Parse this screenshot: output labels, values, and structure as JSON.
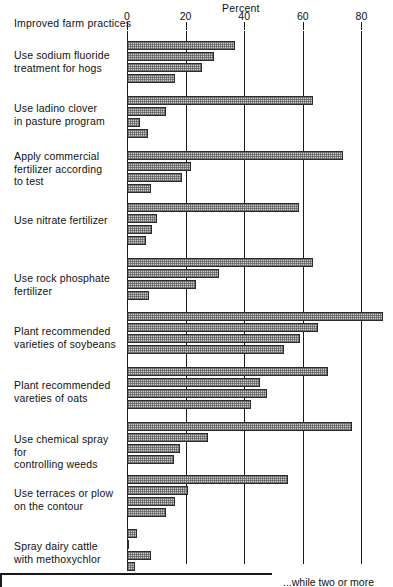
{
  "header": {
    "percent_title": "Percent",
    "category_axis_title": "Improved farm practices"
  },
  "axis": {
    "ticks": [
      "0",
      "20",
      "40",
      "60",
      "80"
    ],
    "tick_values": [
      0,
      20,
      40,
      60,
      80
    ]
  },
  "caption": {
    "fragment": "...while two or more"
  },
  "chart_data": {
    "type": "bar",
    "orientation": "horizontal",
    "title": "Percent",
    "xlabel": "Percent",
    "ylabel": "Improved farm practices",
    "xlim": [
      0,
      90
    ],
    "grid": true,
    "legend_position": "bottom-cropped",
    "categories": [
      "Use sodium fluoride treatment for hogs",
      "Use ladino clover in pasture program",
      "Apply commercial fertilizer according to test",
      "Use nitrate fertilizer",
      "Use rock phosphate fertilizer",
      "Plant recommended varieties of soybeans",
      "Plant recommended vareties of oats",
      "Use chemical spray for controlling weeds",
      "Use terraces or plow on the contour",
      "Spray dairy cattle with methoxychlor"
    ],
    "series": [
      {
        "name": "series-1",
        "values": [
          36.9,
          63.5,
          73.7,
          58.7,
          63.5,
          87.4,
          68.6,
          76.8,
          55.0,
          3.4
        ]
      },
      {
        "name": "series-2",
        "values": [
          29.7,
          13.3,
          21.8,
          10.2,
          31.4,
          65.2,
          45.4,
          27.6,
          20.8,
          0.8
        ]
      },
      {
        "name": "series-3",
        "values": [
          25.6,
          4.4,
          18.8,
          8.5,
          23.5,
          59.0,
          47.8,
          18.1,
          16.4,
          8.2
        ]
      },
      {
        "name": "series-4",
        "values": [
          16.4,
          7.2,
          8.2,
          6.6,
          7.5,
          53.6,
          42.3,
          16.1,
          13.3,
          2.7
        ]
      }
    ]
  },
  "groups": [
    {
      "label_lines": [
        "Use sodium fluoride",
        "treatment for hogs"
      ],
      "label_top": 49,
      "group_top": 41,
      "bars": [
        36.9,
        29.7,
        25.6,
        16.4
      ]
    },
    {
      "label_lines": [
        "Use ladino clover",
        "in pasture program"
      ],
      "label_top": 102,
      "group_top": 96,
      "bars": [
        63.5,
        13.3,
        4.4,
        7.2
      ]
    },
    {
      "label_lines": [
        "Apply commercial",
        "fertilizer according",
        "to test"
      ],
      "label_top": 150,
      "group_top": 151,
      "bars": [
        73.7,
        21.8,
        18.8,
        8.2
      ]
    },
    {
      "label_lines": [
        "Use nitrate fertilizer"
      ],
      "label_top": 214,
      "group_top": 203,
      "bars": [
        58.7,
        10.2,
        8.5,
        6.6
      ]
    },
    {
      "label_lines": [
        "Use rock phosphate",
        "fertilizer"
      ],
      "label_top": 272,
      "group_top": 258,
      "bars": [
        63.5,
        31.4,
        23.5,
        7.5
      ]
    },
    {
      "label_lines": [
        "Plant recommended",
        "varieties of soybeans"
      ],
      "label_top": 325,
      "group_top": 312,
      "bars": [
        87.4,
        65.2,
        59.0,
        53.6
      ]
    },
    {
      "label_lines": [
        "Plant recommended",
        "vareties of oats"
      ],
      "label_top": 379,
      "group_top": 367,
      "bars": [
        68.6,
        45.4,
        47.8,
        42.3
      ]
    },
    {
      "label_lines": [
        "Use chemical spray for",
        "controlling weeds"
      ],
      "label_top": 433,
      "group_top": 422,
      "bars": [
        76.8,
        27.6,
        18.1,
        16.1
      ]
    },
    {
      "label_lines": [
        "Use terraces or plow",
        "on the contour"
      ],
      "label_top": 487,
      "group_top": 475,
      "bars": [
        55.0,
        20.8,
        16.4,
        13.3
      ]
    },
    {
      "label_lines": [
        "Spray dairy cattle",
        "with methoxychlor"
      ],
      "label_top": 540,
      "group_top": 529,
      "bars": [
        3.4,
        0.8,
        8.2,
        2.7
      ]
    }
  ]
}
